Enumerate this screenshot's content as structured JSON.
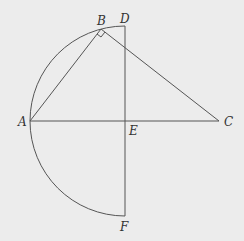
{
  "diagram": {
    "type": "geometry",
    "points": {
      "A": {
        "label": "A",
        "x": 30,
        "y": 121
      },
      "B": {
        "label": "B",
        "x": 101,
        "y": 29
      },
      "C": {
        "label": "C",
        "x": 219,
        "y": 121
      },
      "D": {
        "label": "D",
        "x": 125,
        "y": 26
      },
      "E": {
        "label": "E",
        "x": 125,
        "y": 121
      },
      "F": {
        "label": "F",
        "x": 125,
        "y": 216
      }
    },
    "segments": [
      "AB",
      "BC",
      "AC",
      "DF"
    ],
    "arc": {
      "center": "E",
      "from": "D",
      "to": "F",
      "through": "A"
    },
    "right_angle_at": "B",
    "colors": {
      "stroke": "#555555",
      "background": "#ececec"
    }
  }
}
